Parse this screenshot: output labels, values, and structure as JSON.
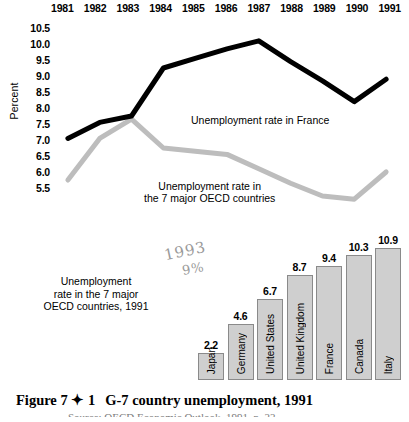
{
  "line_chart": {
    "ylabel": "Percent",
    "y_ticks": [
      "10.5",
      "10.0",
      "9.5",
      "9.0",
      "8.5",
      "8.0",
      "7.5",
      "7.0",
      "6.5",
      "6.0",
      "5.5"
    ],
    "years": [
      "1981",
      "1982",
      "1983",
      "1984",
      "1985",
      "1986",
      "1987",
      "1988",
      "1989",
      "1990",
      "1991"
    ],
    "france_label": "Unemployment rate in France",
    "oecd_label_line1": "Unemployment rate in",
    "oecd_label_line2": "the 7 major OECD countries",
    "france_color": "#000000",
    "oecd_color": "#bdbdbd"
  },
  "bar_chart": {
    "caption_line1": "Unemployment",
    "caption_line2": "rate in the 7 major",
    "caption_line3": "OECD countries, 1991",
    "handwritten_year": "1993",
    "handwritten_pct": "9%",
    "bar_fill": "#cfcfcf",
    "bar_stroke": "#8a8a8a"
  },
  "figure": {
    "label": "Figure 7 ✦ 1",
    "title": "G-7 country unemployment, 1991",
    "source": "Source: OECD Economic Outlook, 1991, p. 22"
  },
  "chart_data": [
    {
      "type": "line",
      "title": "",
      "xlabel": "",
      "ylabel": "Percent",
      "x": [
        1981,
        1982,
        1983,
        1984,
        1985,
        1986,
        1987,
        1988,
        1989,
        1990,
        1991
      ],
      "ylim": [
        5.25,
        10.75
      ],
      "grid": false,
      "legend": "inline-annotations",
      "series": [
        {
          "name": "Unemployment rate in France",
          "color": "#000000",
          "values": [
            7.3,
            7.8,
            8.0,
            9.5,
            9.8,
            10.1,
            10.35,
            9.7,
            9.1,
            8.45,
            9.15
          ]
        },
        {
          "name": "Unemployment rate in the 7 major OECD countries",
          "color": "#bdbdbd",
          "values": [
            6.0,
            7.3,
            7.9,
            7.0,
            6.9,
            6.8,
            6.35,
            5.9,
            5.5,
            5.4,
            6.25
          ]
        }
      ]
    },
    {
      "type": "bar",
      "title": "Unemployment rate in the 7 major OECD countries, 1991",
      "xlabel": "",
      "ylabel": "Percent",
      "categories": [
        "Japan",
        "Germany",
        "United States",
        "United Kingdom",
        "France",
        "Canada",
        "Italy"
      ],
      "values": [
        2.2,
        4.6,
        6.7,
        8.7,
        9.4,
        10.3,
        10.9
      ],
      "value_labels": [
        "2.2",
        "4.6",
        "6.7",
        "8.7",
        "9.4",
        "10.3",
        "10.9"
      ],
      "ylim": [
        0,
        10.9
      ],
      "grid": false
    }
  ]
}
